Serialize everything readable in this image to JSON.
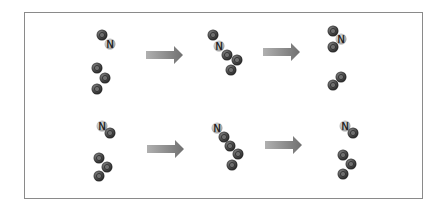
{
  "diagram": {
    "type": "reaction-sequence",
    "colors": {
      "frame_border": "#8a8a8a",
      "oxygen_atom": "#555555",
      "nitrogen_atom": "#b8b8b8",
      "arrow": "#8c8c8c"
    },
    "atom_labels": {
      "nitrogen": "N"
    },
    "rows": [
      {
        "name": "top-row",
        "panels": [
          {
            "name": "reactants",
            "atoms": [
              {
                "el": "O",
                "x": 102,
                "y": 35
              },
              {
                "el": "N",
                "x": 110,
                "y": 44
              },
              {
                "el": "O",
                "x": 97,
                "y": 68
              },
              {
                "el": "O",
                "x": 105,
                "y": 78
              },
              {
                "el": "O",
                "x": 97,
                "y": 89
              }
            ]
          },
          {
            "name": "intermediate",
            "atoms": [
              {
                "el": "O",
                "x": 213,
                "y": 35
              },
              {
                "el": "N",
                "x": 219,
                "y": 46
              },
              {
                "el": "O",
                "x": 227,
                "y": 55
              },
              {
                "el": "O",
                "x": 237,
                "y": 60
              },
              {
                "el": "O",
                "x": 231,
                "y": 70
              }
            ]
          },
          {
            "name": "products",
            "atoms": [
              {
                "el": "O",
                "x": 333,
                "y": 31
              },
              {
                "el": "N",
                "x": 341,
                "y": 39
              },
              {
                "el": "O",
                "x": 333,
                "y": 47
              },
              {
                "el": "O",
                "x": 341,
                "y": 77
              },
              {
                "el": "O",
                "x": 333,
                "y": 85
              }
            ]
          }
        ],
        "arrows": [
          {
            "x1": 146,
            "x2": 183,
            "y": 55
          },
          {
            "x1": 263,
            "x2": 300,
            "y": 52
          }
        ]
      },
      {
        "name": "bottom-row",
        "panels": [
          {
            "name": "reactants",
            "atoms": [
              {
                "el": "N",
                "x": 102,
                "y": 126
              },
              {
                "el": "O",
                "x": 110,
                "y": 133
              },
              {
                "el": "O",
                "x": 99,
                "y": 158
              },
              {
                "el": "O",
                "x": 107,
                "y": 167
              },
              {
                "el": "O",
                "x": 99,
                "y": 176
              }
            ]
          },
          {
            "name": "intermediate",
            "atoms": [
              {
                "el": "N",
                "x": 217,
                "y": 128
              },
              {
                "el": "O",
                "x": 224,
                "y": 137
              },
              {
                "el": "O",
                "x": 230,
                "y": 146
              },
              {
                "el": "O",
                "x": 238,
                "y": 154
              },
              {
                "el": "O",
                "x": 232,
                "y": 165
              }
            ]
          },
          {
            "name": "products",
            "atoms": [
              {
                "el": "N",
                "x": 345,
                "y": 126
              },
              {
                "el": "O",
                "x": 353,
                "y": 133
              },
              {
                "el": "O",
                "x": 343,
                "y": 155
              },
              {
                "el": "O",
                "x": 351,
                "y": 164
              },
              {
                "el": "O",
                "x": 343,
                "y": 174
              }
            ]
          }
        ],
        "arrows": [
          {
            "x1": 147,
            "x2": 184,
            "y": 149
          },
          {
            "x1": 265,
            "x2": 302,
            "y": 145
          }
        ]
      }
    ]
  }
}
